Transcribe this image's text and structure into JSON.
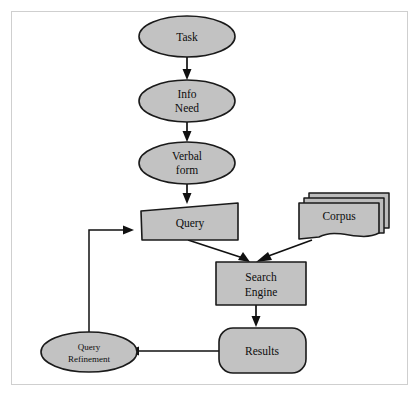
{
  "diagram": {
    "frame": {
      "border_color": "#cfcfcf",
      "background": "#ffffff"
    },
    "style": {
      "node_fill": "#c2c2c2",
      "node_stroke": "#1a1a1a",
      "line_color": "#111111",
      "text_color": "#0d0d0d"
    },
    "nodes": [
      {
        "id": "task",
        "label": "Task",
        "shape": "ellipse"
      },
      {
        "id": "info-need",
        "label_line1": "Info",
        "label_line2": "Need",
        "shape": "ellipse"
      },
      {
        "id": "verbal-form",
        "label_line1": "Verbal",
        "label_line2": "form",
        "shape": "ellipse"
      },
      {
        "id": "query",
        "label": "Query",
        "shape": "slanted-quadrilateral"
      },
      {
        "id": "corpus",
        "label": "Corpus",
        "shape": "stacked-documents"
      },
      {
        "id": "search-engine",
        "label_line1": "Search",
        "label_line2": "Engine",
        "shape": "rectangle"
      },
      {
        "id": "results",
        "label": "Results",
        "shape": "rounded-rectangle"
      },
      {
        "id": "query-refinement",
        "label_line1": "Query",
        "label_line2": "Refinement",
        "shape": "ellipse"
      }
    ],
    "edges": [
      {
        "id": "task-to-info-need",
        "from": "task",
        "to": "info-need"
      },
      {
        "id": "info-need-to-verbal-form",
        "from": "info-need",
        "to": "verbal-form"
      },
      {
        "id": "verbal-form-to-query",
        "from": "verbal-form",
        "to": "query"
      },
      {
        "id": "query-to-search-engine",
        "from": "query",
        "to": "search-engine"
      },
      {
        "id": "corpus-to-search-engine",
        "from": "corpus",
        "to": "search-engine"
      },
      {
        "id": "search-engine-to-results",
        "from": "search-engine",
        "to": "results"
      },
      {
        "id": "results-to-query-refinement",
        "from": "results",
        "to": "query-refinement"
      },
      {
        "id": "query-refinement-to-query",
        "from": "query-refinement",
        "to": "query"
      }
    ]
  }
}
